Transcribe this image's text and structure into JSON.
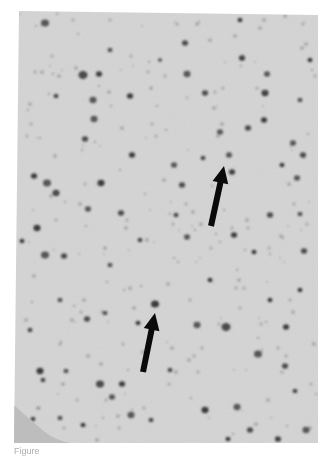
{
  "figure": {
    "background_color": "#d6d6d6",
    "cell_color": "#2e2e2e",
    "arrow_color": "#0a0a0a",
    "annotations": [
      {
        "type": "arrow",
        "label": "upper-arrow",
        "points_to": "stained cell"
      },
      {
        "type": "arrow",
        "label": "lower-arrow",
        "points_to": "stained cell"
      }
    ]
  },
  "caption": {
    "text": "Figure"
  }
}
